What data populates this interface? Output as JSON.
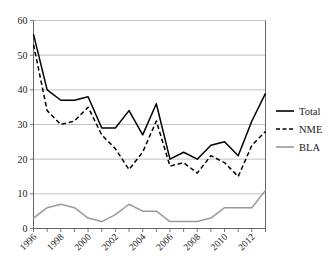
{
  "chart_data": {
    "type": "line",
    "title": "",
    "subtitle": "",
    "xlabel": "",
    "ylabel": "",
    "x": [
      1996,
      1997,
      1998,
      1999,
      2000,
      2001,
      2002,
      2003,
      2004,
      2005,
      2006,
      2007,
      2008,
      2009,
      2010,
      2011,
      2012,
      2013
    ],
    "xlim": [
      1996,
      2013
    ],
    "ylim": [
      0,
      60
    ],
    "yticks": [
      0,
      10,
      20,
      30,
      40,
      50,
      60
    ],
    "xticks_labeled": [
      1996,
      1998,
      2000,
      2002,
      2004,
      2006,
      2008,
      2010,
      2012
    ],
    "xtick_labels": [
      "1996",
      "1998",
      "2000",
      "2002",
      "2004",
      "2006",
      "2008",
      "2010",
      "2012"
    ],
    "ytick_labels": [
      "0",
      "10",
      "20",
      "30",
      "40",
      "50",
      "60"
    ],
    "grid": true,
    "grid_axis": "y",
    "legend_position": "right",
    "series": [
      {
        "name": "Total",
        "style": "solid",
        "color": "#000000",
        "values": [
          56,
          40,
          37,
          37,
          38,
          29,
          29,
          34,
          27,
          36,
          20,
          22,
          20,
          24,
          25,
          21,
          31,
          39
        ]
      },
      {
        "name": "NME",
        "style": "dashed",
        "color": "#000000",
        "values": [
          53,
          34,
          30,
          31,
          35,
          27,
          23,
          17,
          22,
          31,
          18,
          19,
          16,
          21,
          19,
          15,
          24,
          28
        ]
      },
      {
        "name": "BLA",
        "style": "solid",
        "color": "#9a9a9a",
        "values": [
          3,
          6,
          7,
          6,
          3,
          2,
          4,
          7,
          5,
          5,
          2,
          2,
          2,
          3,
          6,
          6,
          6,
          11
        ]
      }
    ]
  },
  "legend": {
    "entries": [
      {
        "label": "Total"
      },
      {
        "label": "NME"
      },
      {
        "label": "BLA"
      }
    ]
  },
  "colors": {
    "total": "#000000",
    "nme": "#000000",
    "bla": "#9a9a9a",
    "grid": "#a8a8a8",
    "axis": "#555555",
    "background": "#ffffff"
  }
}
